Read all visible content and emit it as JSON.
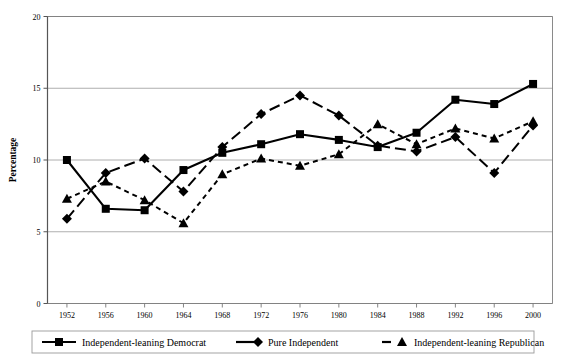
{
  "chart_data": {
    "type": "line",
    "title": "",
    "subtitle": "",
    "xlabel": "",
    "ylabel": "Percentage",
    "categories": [
      "1952",
      "1956",
      "1960",
      "1964",
      "1968",
      "1972",
      "1976",
      "1980",
      "1984",
      "1988",
      "1992",
      "1996",
      "2000"
    ],
    "x": [
      1952,
      1956,
      1960,
      1964,
      1968,
      1972,
      1976,
      1980,
      1984,
      1988,
      1992,
      1996,
      2000
    ],
    "ylim": [
      0,
      20
    ],
    "yticks": [
      "0",
      "5",
      "10",
      "15",
      "20"
    ],
    "ytick_values": [
      0,
      5,
      10,
      15,
      20
    ],
    "grid": "horizontal",
    "legend_position": "bottom",
    "series": [
      {
        "name": "Independent-leaning Democrat",
        "marker": "square",
        "line": "solid",
        "color": "#000000",
        "values": [
          10.0,
          6.6,
          6.5,
          9.3,
          10.5,
          11.1,
          11.8,
          11.4,
          10.9,
          11.9,
          14.2,
          13.9,
          15.3
        ]
      },
      {
        "name": "Pure Independent",
        "marker": "diamond",
        "line": "dashed",
        "color": "#000000",
        "values": [
          5.9,
          9.1,
          10.1,
          7.8,
          10.9,
          13.2,
          14.5,
          13.1,
          11.0,
          10.6,
          11.6,
          9.1,
          12.4
        ]
      },
      {
        "name": "Independent-leaning Republican",
        "marker": "triangle",
        "line": "dotted",
        "color": "#000000",
        "values": [
          7.3,
          8.5,
          7.2,
          5.6,
          9.0,
          10.1,
          9.6,
          10.4,
          12.5,
          11.1,
          12.2,
          11.5,
          12.7
        ]
      }
    ]
  },
  "axis": {
    "y_title": "Percentage"
  },
  "legend": {
    "items": [
      {
        "label": "Independent-leaning Democrat",
        "marker": "square",
        "line": "solid"
      },
      {
        "label": "Pure Independent",
        "marker": "diamond",
        "line": "solid-short"
      },
      {
        "label": "Independent-leaning Republican",
        "marker": "triangle",
        "line": "dashed"
      }
    ]
  }
}
